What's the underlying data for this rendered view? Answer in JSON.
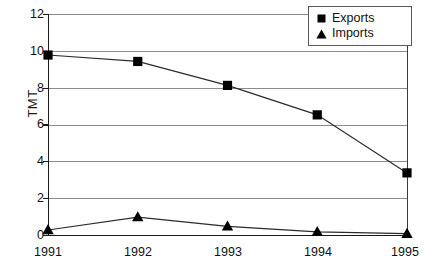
{
  "chart_data": {
    "type": "line",
    "title": "",
    "xlabel": "",
    "ylabel": "TMT",
    "categories": [
      "1991",
      "1992",
      "1993",
      "1994",
      "1995"
    ],
    "x": [
      1991,
      1992,
      1993,
      1994,
      1995
    ],
    "series": [
      {
        "name": "Exports",
        "marker": "square",
        "color": "#000000",
        "values": [
          9.8,
          9.45,
          8.15,
          6.55,
          3.4
        ]
      },
      {
        "name": "Imports",
        "marker": "triangle",
        "color": "#000000",
        "values": [
          0.3,
          1.0,
          0.5,
          0.2,
          0.1
        ]
      }
    ],
    "ylim": [
      0,
      12
    ],
    "yticks": [
      0,
      2,
      4,
      6,
      8,
      10,
      12
    ],
    "ytick_labels": [
      "0",
      "2",
      "4",
      "6",
      "8",
      "10",
      "12"
    ],
    "xtick_labels": [
      "1991",
      "1992",
      "1993",
      "1994",
      "1995"
    ],
    "grid": true,
    "grid_axis": "y",
    "grid_color": "#8c8c8c",
    "legend_position": "top-right",
    "legend_entries": [
      "Exports",
      "Imports"
    ],
    "axis_color": "#1a1a1a",
    "plot_background": "#ffffff"
  },
  "legend": {
    "entries": [
      {
        "label": "Exports",
        "marker": "square-marker"
      },
      {
        "label": "Imports",
        "marker": "triangle-marker"
      }
    ]
  },
  "axes": {
    "y_title": "TMT",
    "y_labels": [
      "12",
      "10",
      "8",
      "6",
      "4",
      "2",
      "0"
    ],
    "x_labels": [
      "1991",
      "1992",
      "1993",
      "1994",
      "1995"
    ]
  }
}
